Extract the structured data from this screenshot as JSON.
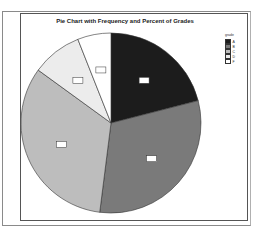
{
  "chart_data": {
    "type": "pie",
    "title": "Pie Chart with Frequency and Percent of Grades",
    "legend_title": "grade",
    "legend_position": "right",
    "categories": [
      "A",
      "B",
      "C",
      "D",
      "F"
    ],
    "values": [
      21,
      31,
      33,
      9,
      6
    ],
    "value_unit": "percent (estimated)",
    "colors": [
      "#1c1c1c",
      "#7a7a7a",
      "#bdbdbd",
      "#ececec",
      "#ffffff"
    ],
    "slice_labels_note": "each slice has a small boxed frequency/percent label (illegible)"
  }
}
